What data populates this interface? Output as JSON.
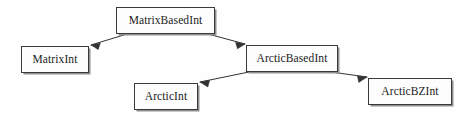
{
  "diagram": {
    "type": "class-hierarchy",
    "title": "",
    "background_color": "#fefefe",
    "box_fill_color": "#fdfdfd",
    "box_border_color": "#3a3a3a",
    "edge_color": "#333333",
    "text_color": "#1b1b1b",
    "nodes": [
      {
        "id": "matrix-based-int",
        "label": "MatrixBasedInt",
        "x": 116,
        "y": 7,
        "width": 99,
        "height": 27
      },
      {
        "id": "matrix-int",
        "label": "MatrixInt",
        "x": 21,
        "y": 46,
        "width": 68,
        "height": 27
      },
      {
        "id": "arctic-based-int",
        "label": "ArcticBasedInt",
        "x": 246,
        "y": 45,
        "width": 92,
        "height": 27
      },
      {
        "id": "arctic-int",
        "label": "ArcticInt",
        "x": 134,
        "y": 83,
        "width": 64,
        "height": 27
      },
      {
        "id": "arctic-bz-int",
        "label": "ArcticBZInt",
        "x": 368,
        "y": 78,
        "width": 84,
        "height": 27
      }
    ],
    "edges": [
      {
        "id": "edge-matrixbasedint-to-matrixint",
        "from": "matrix-based-int",
        "to": "matrix-int",
        "from_point": [
          127,
          34
        ],
        "to_point": [
          91,
          45
        ],
        "arrowhead": "open",
        "label": ""
      },
      {
        "id": "edge-matrixbasedint-to-arcticbasedint",
        "from": "matrix-based-int",
        "to": "arctic-based-int",
        "from_point": [
          208,
          34
        ],
        "to_point": [
          245,
          44
        ],
        "arrowhead": "open",
        "label": ""
      },
      {
        "id": "edge-arcticbasedint-to-arcticint",
        "from": "arctic-based-int",
        "to": "arctic-int",
        "from_point": [
          249,
          72
        ],
        "to_point": [
          200,
          82
        ],
        "arrowhead": "open",
        "label": ""
      },
      {
        "id": "edge-arcticbasedint-to-arcticbzint",
        "from": "arctic-based-int",
        "to": "arctic-bz-int",
        "from_point": [
          331,
          72
        ],
        "to_point": [
          367,
          77
        ],
        "arrowhead": "open",
        "label": ""
      }
    ]
  }
}
